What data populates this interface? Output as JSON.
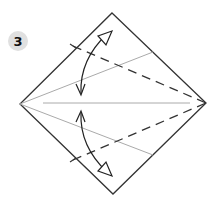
{
  "step": {
    "number": "3",
    "badge_color": "#e0e0e0"
  },
  "diagram": {
    "type": "origami-fold-instruction",
    "shape": "square-rotated-diamond",
    "colors": {
      "outline": "#333333",
      "crease": "#aaaaaa",
      "valley_fold": "#333333",
      "arrow": "#222222"
    },
    "elements": [
      "diamond-outline",
      "center-crease",
      "upper-crease",
      "lower-crease",
      "upper-valley-fold-dashed",
      "lower-valley-fold-dashed",
      "upper-fold-unfold-arrow",
      "lower-fold-unfold-arrow"
    ]
  }
}
